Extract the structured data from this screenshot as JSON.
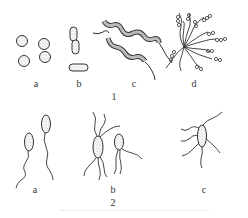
{
  "figure": {
    "type": "scientific line drawing",
    "ink_color": "#333333",
    "stipple_color": "#9a9a9a",
    "background": "#ffffff"
  },
  "group1": {
    "label": "1",
    "panels": [
      {
        "label": "a",
        "depicts": "cocci (spherical cells, single and paired)"
      },
      {
        "label": "b",
        "depicts": "rods (short bacilli, chained and single)"
      },
      {
        "label": "c",
        "depicts": "spiral cells with terminal flagella"
      },
      {
        "label": "d",
        "depicts": "cluster of cells with radiating coiled filaments"
      }
    ]
  },
  "group2": {
    "label": "2",
    "panels": [
      {
        "label": "a",
        "depicts": "monotrichous (single polar flagellum)"
      },
      {
        "label": "b",
        "depicts": "lophotrichous / amphitrichous (tufts of flagella)"
      },
      {
        "label": "c",
        "depicts": "peritrichous (flagella around the cell)"
      }
    ]
  }
}
